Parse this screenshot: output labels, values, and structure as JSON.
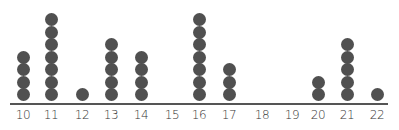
{
  "chart_data": {
    "type": "dot plot",
    "title": "",
    "xlabel": "",
    "ylabel": "",
    "categories": [
      "10",
      "11",
      "12",
      "13",
      "14",
      "15",
      "16",
      "17",
      "18",
      "19",
      "20",
      "21",
      "22"
    ],
    "values": [
      4,
      7,
      1,
      5,
      4,
      0,
      7,
      3,
      0,
      0,
      2,
      5,
      1
    ],
    "x_positions": [
      23,
      51,
      82,
      111,
      141,
      172,
      199,
      229,
      262,
      292,
      318,
      347,
      377
    ],
    "grid": false,
    "legend": null,
    "colors": {
      "dot": "#505050",
      "axis": "#555555"
    }
  }
}
